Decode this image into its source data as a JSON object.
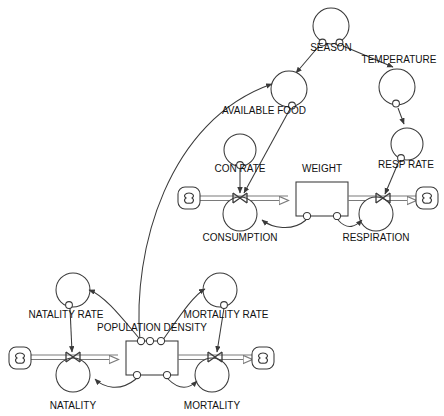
{
  "diagram": {
    "type": "system-dynamics-stock-and-flow",
    "title": "",
    "colors": {
      "line": "#3a3a3a",
      "pipe": "#7a7a7a",
      "text": "#111111",
      "background": "#ffffff",
      "stock_fill": "#ffffff"
    },
    "stocks": [
      {
        "name": "WEIGHT",
        "label": "WEIGHT",
        "x": 296,
        "y": 182,
        "w": 52,
        "h": 34,
        "label_x": 322,
        "label_y": 172,
        "top_ports": 0,
        "bottom_ports": 2
      },
      {
        "name": "POPULATION DENSITY",
        "label": "POPULATION DENSITY",
        "x": 126,
        "y": 341,
        "w": 52,
        "h": 34,
        "label_x": 152,
        "label_y": 331,
        "top_ports": 3,
        "bottom_ports": 2
      }
    ],
    "flows": [
      {
        "name": "CONSUMPTION",
        "label": "CONSUMPTION",
        "valve_x": 240,
        "valve_y": 199,
        "circle_cx": 240,
        "circle_cy": 214,
        "r": 17,
        "label_x": 240,
        "label_y": 241,
        "direction": "inflow",
        "source": "cloud",
        "target": "WEIGHT"
      },
      {
        "name": "RESPIRATION",
        "label": "RESPIRATION",
        "valve_x": 383,
        "valve_y": 199,
        "circle_cx": 376,
        "circle_cy": 214,
        "r": 17,
        "label_x": 376,
        "label_y": 241,
        "direction": "outflow",
        "source": "WEIGHT",
        "target": "cloud"
      },
      {
        "name": "NATALITY",
        "label": "NATALITY",
        "valve_x": 73,
        "valve_y": 358,
        "circle_cx": 73,
        "circle_cy": 375,
        "r": 17,
        "label_x": 73,
        "label_y": 408,
        "direction": "inflow",
        "source": "cloud",
        "target": "POPULATION DENSITY"
      },
      {
        "name": "MORTALITY",
        "label": "MORTALITY",
        "valve_x": 215,
        "valve_y": 358,
        "circle_cx": 212,
        "circle_cy": 375,
        "r": 17,
        "label_x": 212,
        "label_y": 408,
        "direction": "outflow",
        "source": "POPULATION DENSITY",
        "target": "cloud"
      }
    ],
    "converters": [
      {
        "name": "SEASON",
        "label": "SEASON",
        "cx": 331,
        "cy": 26,
        "r": 18,
        "label_x": 331,
        "label_y": 51
      },
      {
        "name": "TEMPERATURE",
        "label": "TEMPERATURE",
        "cx": 397,
        "cy": 87,
        "r": 18,
        "label_x": 399,
        "label_y": 63
      },
      {
        "name": "AVAILABLE FOOD",
        "label": "AVAILABLE FOOD",
        "cx": 289,
        "cy": 89,
        "r": 18,
        "label_x": 264,
        "label_y": 114
      },
      {
        "name": "CON RATE",
        "label": "CON RATE",
        "cx": 240,
        "cy": 150,
        "r": 16,
        "label_x": 240,
        "label_y": 172
      },
      {
        "name": "RESP RATE",
        "label": "RESP RATE",
        "cx": 407,
        "cy": 144,
        "r": 16,
        "label_x": 406,
        "label_y": 168
      },
      {
        "name": "NATALITY RATE",
        "label": "NATALITY RATE",
        "cx": 73,
        "cy": 290,
        "r": 17,
        "label_x": 66,
        "label_y": 317
      },
      {
        "name": "MORTALITY RATE",
        "label": "MORTALITY RATE",
        "cx": 220,
        "cy": 290,
        "r": 17,
        "label_x": 225,
        "label_y": 317
      }
    ],
    "clouds": [
      {
        "name": "consumption-source-cloud",
        "cx": 189,
        "cy": 198,
        "r": 11
      },
      {
        "name": "respiration-sink-cloud",
        "cx": 427,
        "cy": 198,
        "r": 11
      },
      {
        "name": "natality-source-cloud",
        "cx": 20,
        "cy": 358,
        "r": 11
      },
      {
        "name": "mortality-sink-cloud",
        "cx": 263,
        "cy": 358,
        "r": 11
      }
    ],
    "connectors": [
      {
        "name": "season-to-available-food",
        "from": "SEASON",
        "to": "AVAILABLE FOOD"
      },
      {
        "name": "season-to-temperature",
        "from": "SEASON",
        "to": "TEMPERATURE"
      },
      {
        "name": "temperature-to-resp-rate",
        "from": "TEMPERATURE",
        "to": "RESP RATE"
      },
      {
        "name": "available-food-to-consumption",
        "from": "AVAILABLE FOOD",
        "to": "CONSUMPTION"
      },
      {
        "name": "con-rate-to-consumption",
        "from": "CON RATE",
        "to": "CONSUMPTION"
      },
      {
        "name": "resp-rate-to-respiration",
        "from": "RESP RATE",
        "to": "RESPIRATION"
      },
      {
        "name": "weight-to-consumption",
        "from": "WEIGHT",
        "to": "CONSUMPTION"
      },
      {
        "name": "weight-to-respiration",
        "from": "WEIGHT",
        "to": "RESPIRATION"
      },
      {
        "name": "population-density-to-available-food",
        "from": "POPULATION DENSITY",
        "to": "AVAILABLE FOOD"
      },
      {
        "name": "population-density-to-natality-rate",
        "from": "POPULATION DENSITY",
        "to": "NATALITY RATE"
      },
      {
        "name": "population-density-to-mortality-rate",
        "from": "POPULATION DENSITY",
        "to": "MORTALITY RATE"
      },
      {
        "name": "natality-rate-to-natality",
        "from": "NATALITY RATE",
        "to": "NATALITY"
      },
      {
        "name": "mortality-rate-to-mortality",
        "from": "MORTALITY RATE",
        "to": "MORTALITY"
      },
      {
        "name": "population-density-to-natality",
        "from": "POPULATION DENSITY",
        "to": "NATALITY"
      },
      {
        "name": "population-density-to-mortality",
        "from": "POPULATION DENSITY",
        "to": "MORTALITY"
      }
    ],
    "labels": {
      "season": "SEASON",
      "temperature": "TEMPERATURE",
      "available_food": "AVAILABLE FOOD",
      "con_rate": "CON RATE",
      "weight": "WEIGHT",
      "resp_rate": "RESP RATE",
      "consumption": "CONSUMPTION",
      "respiration": "RESPIRATION",
      "natality_rate": "NATALITY RATE",
      "mortality_rate": "MORTALITY RATE",
      "population_density": "POPULATION DENSITY",
      "natality": "NATALITY",
      "mortality": "MORTALITY"
    }
  }
}
